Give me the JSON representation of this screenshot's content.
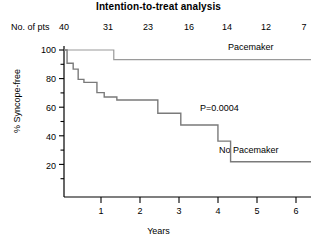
{
  "chart_data": {
    "type": "line",
    "title": "Intention-to-treat analysis",
    "xlabel": "Years",
    "ylabel": "% Syncope-free",
    "xlim": [
      0,
      6.45
    ],
    "ylim": [
      0,
      105
    ],
    "grid": false,
    "legend_position": "inline-right",
    "annotations": [
      {
        "text": "P=0.0004",
        "x": 3.55,
        "y": 62
      },
      {
        "text": "Pacemaker",
        "x": 5.0,
        "y": 98
      },
      {
        "text": "No Pacemaker",
        "x": 4.45,
        "y": 30
      }
    ],
    "xticks": [
      0,
      1,
      2,
      3,
      4,
      5,
      6
    ],
    "xtick_labels": [
      "",
      "1",
      "2",
      "3",
      "4",
      "5",
      "6"
    ],
    "yticks": [
      20,
      40,
      60,
      80,
      100
    ],
    "ytick_labels": [
      "20",
      "40",
      "60",
      "80",
      "100"
    ],
    "yminor_ticks": [
      10,
      30,
      50,
      70,
      90
    ],
    "at_risk": {
      "label": "No. of pts",
      "times": [
        0,
        1,
        2,
        3,
        4,
        5,
        6
      ],
      "counts": [
        "40",
        "31",
        "23",
        "16",
        "14",
        "12",
        "7"
      ]
    },
    "series": [
      {
        "name": "Pacemaker",
        "color": "#9a9a9a",
        "step": "post",
        "x": [
          0.0,
          1.3,
          1.3,
          6.45
        ],
        "y": [
          100,
          100,
          93.5,
          93.5
        ]
      },
      {
        "name": "No Pacemaker",
        "color": "#7a7a7a",
        "step": "post",
        "x": [
          0.0,
          0.08,
          0.08,
          0.24,
          0.24,
          0.37,
          0.37,
          0.52,
          0.52,
          0.86,
          0.86,
          1.05,
          1.05,
          1.38,
          1.38,
          2.45,
          2.45,
          3.05,
          3.05,
          4.02,
          4.02,
          4.35,
          4.35,
          6.45
        ],
        "y": [
          100,
          100,
          91,
          91,
          87,
          87,
          80,
          80,
          78,
          78,
          71,
          71,
          68,
          68,
          66,
          66,
          57,
          57,
          49,
          49,
          38,
          38,
          24,
          24
        ]
      }
    ]
  }
}
